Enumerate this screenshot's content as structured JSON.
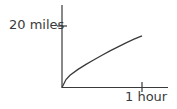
{
  "chart_data": {
    "type": "line",
    "title": "",
    "xlabel": "",
    "ylabel": "",
    "x_ticks": [
      {
        "value": 1,
        "label": "1 hour"
      }
    ],
    "y_ticks": [
      {
        "value": 20,
        "label": "20 miles"
      }
    ],
    "xlim": [
      0,
      1.3
    ],
    "ylim": [
      0,
      27
    ],
    "grid": false,
    "legend": null,
    "series": [
      {
        "name": "distance",
        "x": [
          0,
          0.05,
          0.1,
          0.2,
          0.3,
          0.4,
          0.5,
          0.6,
          0.7,
          0.8,
          0.9,
          1.0
        ],
        "y": [
          0,
          2.6,
          4.0,
          5.9,
          7.5,
          9.0,
          10.5,
          11.9,
          13.2,
          14.5,
          15.7,
          16.8
        ]
      }
    ],
    "colors": {
      "axis": "#3a3a3a",
      "line": "#3a3a3a",
      "text": "#3a3a3a"
    }
  },
  "labels": {
    "y_tick": "20 miles",
    "x_tick": "1 hour"
  }
}
